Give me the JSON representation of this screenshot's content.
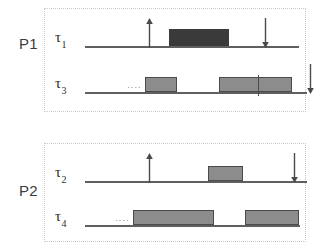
{
  "diagram": {
    "colors": {
      "panel_border": "#c9c9c9",
      "axis": "#5f5f5f",
      "block_dark": "#3a3a3a",
      "block_gray": "#8c8c8c",
      "block_border": "#4a4a4a",
      "arrow": "#4a4a4a",
      "text": "#2b2b2b"
    },
    "processors": [
      {
        "id": "P1",
        "label": "P1",
        "tasks": [
          {
            "id": "tau1",
            "label": "τ",
            "subscript": "1",
            "name": "task-tau-1",
            "dots_prefix": "",
            "blocks": [
              {
                "name": "exec-block-tau1-1",
                "start": 124,
                "width": 60,
                "height": 17,
                "shade": "dark",
                "dividers": []
              }
            ],
            "arrows": [
              {
                "name": "release-arrow-tau1",
                "direction": "up",
                "x": 104
              },
              {
                "name": "deadline-arrow-tau1",
                "direction": "down",
                "x": 220
              }
            ]
          },
          {
            "id": "tau3",
            "label": "τ",
            "subscript": "3",
            "name": "task-tau-3",
            "dots_prefix": "····",
            "blocks": [
              {
                "name": "exec-block-tau3-1",
                "start": 100,
                "width": 32,
                "height": 15,
                "shade": "gray",
                "dividers": []
              },
              {
                "name": "exec-block-tau3-2",
                "start": 174,
                "width": 73,
                "height": 15,
                "shade": "gray",
                "dividers": [
                  38
                ]
              }
            ],
            "arrows": [
              {
                "name": "deadline-arrow-tau3",
                "direction": "down",
                "x": 265
              }
            ]
          }
        ]
      },
      {
        "id": "P2",
        "label": "P2",
        "tasks": [
          {
            "id": "tau2",
            "label": "τ",
            "subscript": "2",
            "name": "task-tau-2",
            "dots_prefix": "",
            "blocks": [
              {
                "name": "exec-block-tau2-1",
                "start": 163,
                "width": 35,
                "height": 15,
                "shade": "gray",
                "dividers": []
              }
            ],
            "arrows": [
              {
                "name": "release-arrow-tau2",
                "direction": "up",
                "x": 104
              },
              {
                "name": "deadline-arrow-tau2",
                "direction": "down",
                "x": 249
              }
            ]
          },
          {
            "id": "tau4",
            "label": "τ",
            "subscript": "4",
            "name": "task-tau-4",
            "dots_prefix": "····",
            "blocks": [
              {
                "name": "exec-block-tau4-1",
                "start": 88,
                "width": 81,
                "height": 15,
                "shade": "gray",
                "dividers": []
              },
              {
                "name": "exec-block-tau4-2",
                "start": 200,
                "width": 54,
                "height": 15,
                "shade": "gray",
                "dividers": []
              }
            ],
            "arrows": [
              {
                "name": "deadline-arrow-tau4",
                "direction": "down",
                "x": 285
              }
            ]
          }
        ]
      }
    ]
  }
}
